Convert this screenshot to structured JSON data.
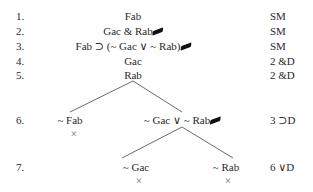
{
  "rows": [
    {
      "num": "1.",
      "formula": "Fab",
      "checked": false,
      "justification": "SM"
    },
    {
      "num": "2.",
      "formula": "Gac & Rab",
      "checked": true,
      "justification": "SM"
    },
    {
      "num": "3.",
      "formula": "Fab ⊃ (~ Gac ∨ ~ Rab)",
      "checked": true,
      "justification": "SM"
    },
    {
      "num": "4.",
      "formula": "Gac",
      "checked": false,
      "justification": "2 &D"
    },
    {
      "num": "5.",
      "formula": "Rab",
      "checked": false,
      "justification": "2 &D"
    },
    {
      "num": "6.",
      "left": "~ Fab",
      "right": "~ Gac ∨ ~ Rab",
      "right_checked": true,
      "justification": "3 ⊃D",
      "left_closed": "×"
    },
    {
      "num": "7.",
      "left": "~ Gac",
      "right": "~ Rab",
      "justification": "6 ∨D",
      "left_closed": "×",
      "right_closed": "×"
    }
  ]
}
